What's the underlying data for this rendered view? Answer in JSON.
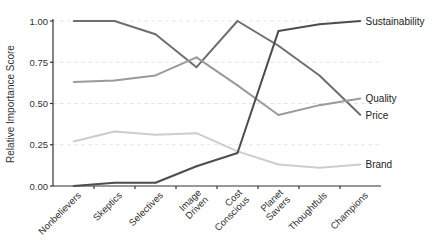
{
  "chart_data": {
    "type": "line",
    "title": "",
    "xlabel": "",
    "ylabel": "Relative Importance Score",
    "ylim": [
      0,
      1
    ],
    "yticks": [
      "0.00",
      "0.25",
      "0.50",
      "0.75",
      "1.00"
    ],
    "ytick_values": [
      0,
      0.25,
      0.5,
      0.75,
      1.0
    ],
    "grid": true,
    "legend": "direct-labels-right",
    "categories": [
      [
        "Nonbelievers"
      ],
      [
        "Skeptics"
      ],
      [
        "Selectives"
      ],
      [
        "Image",
        "Driven"
      ],
      [
        "Cost",
        "Conscious"
      ],
      [
        "Planet",
        "Savers"
      ],
      [
        "Thoughtfuls"
      ],
      [
        "Champions"
      ]
    ],
    "series": [
      {
        "name": "Price",
        "color": "#6e6e6e",
        "values": [
          1.0,
          1.0,
          0.92,
          0.72,
          1.0,
          0.85,
          0.67,
          0.43
        ]
      },
      {
        "name": "Quality",
        "color": "#9a9a9a",
        "values": [
          0.63,
          0.64,
          0.67,
          0.78,
          0.61,
          0.43,
          0.49,
          0.53
        ]
      },
      {
        "name": "Brand",
        "color": "#cdcdcd",
        "values": [
          0.27,
          0.33,
          0.31,
          0.32,
          0.21,
          0.13,
          0.11,
          0.13
        ]
      },
      {
        "name": "Sustainability",
        "color": "#4d4d4d",
        "values": [
          0.0,
          0.02,
          0.02,
          0.12,
          0.2,
          0.94,
          0.98,
          1.0
        ]
      }
    ]
  }
}
